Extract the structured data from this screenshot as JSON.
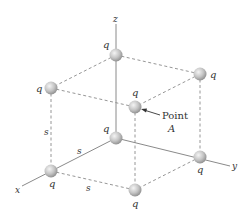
{
  "diagram": {
    "title": "",
    "axes": {
      "x_label": "x",
      "y_label": "y",
      "z_label": "z"
    },
    "charges": [
      {
        "id": "top-back",
        "label": "q",
        "x": 116,
        "y": 55
      },
      {
        "id": "top-left",
        "label": "q",
        "x": 51,
        "y": 88
      },
      {
        "id": "top-right",
        "label": "q",
        "x": 200,
        "y": 74
      },
      {
        "id": "top-front",
        "label": "q",
        "x": 135,
        "y": 107
      },
      {
        "id": "origin",
        "label": "q",
        "x": 116,
        "y": 138
      },
      {
        "id": "x-axis",
        "label": "q",
        "x": 51,
        "y": 171
      },
      {
        "id": "y-axis",
        "label": "q",
        "x": 200,
        "y": 157
      },
      {
        "id": "bottom-front",
        "label": "q",
        "x": 135,
        "y": 190
      }
    ],
    "edge_labels": {
      "vertical": "s",
      "x_edge": "s",
      "front_edge": "s"
    },
    "annotation": {
      "line1": "Point",
      "line2": "A"
    },
    "colors": {
      "axis": "#8a8a8a",
      "dashed": "#8a8a8a",
      "sphere_light": "#f2f2f2",
      "sphere_dark": "#8f8f8f",
      "text": "#333333"
    }
  }
}
